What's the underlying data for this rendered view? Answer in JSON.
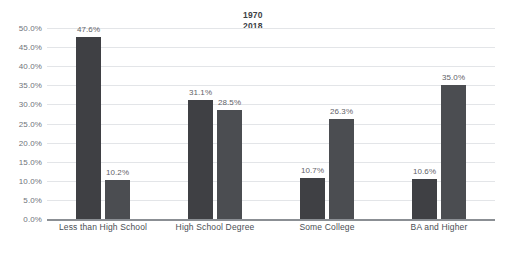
{
  "chart_data": {
    "type": "bar",
    "title": "",
    "xlabel": "",
    "ylabel": "",
    "ylim": [
      0,
      50
    ],
    "grid": true,
    "legend_position": "top-center",
    "categories": [
      "Less than High School",
      "High School Degree",
      "Some College",
      "BA and Higher"
    ],
    "series": [
      {
        "name": "1970",
        "color": "#3f4044",
        "values": [
          47.6,
          31.1,
          10.7,
          10.6
        ],
        "labels": [
          "47.6%",
          "31.1%",
          "10.7%",
          "10.6%"
        ]
      },
      {
        "name": "2018",
        "color": "#4b4d51",
        "values": [
          10.2,
          28.5,
          26.3,
          35.0
        ],
        "labels": [
          "10.2%",
          "28.5%",
          "26.3%",
          "35.0%"
        ]
      }
    ],
    "yticks": [
      0,
      5,
      10,
      15,
      20,
      25,
      30,
      35,
      40,
      45,
      50
    ],
    "ytick_labels": [
      "0.0%",
      "5.0%",
      "10.0%",
      "15.0%",
      "20.0%",
      "25.0%",
      "30.0%",
      "35.0%",
      "40.0%",
      "45.0%",
      "50.0%"
    ]
  },
  "legend": {
    "entries": [
      "1970",
      "2018"
    ]
  }
}
